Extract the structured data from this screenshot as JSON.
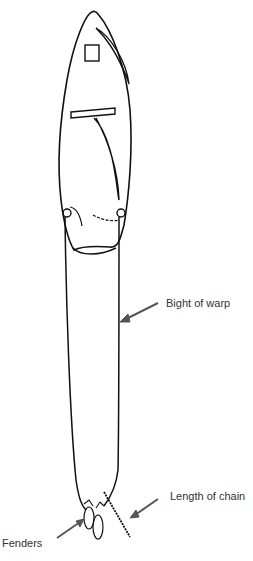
{
  "diagram": {
    "type": "boat mooring illustration (top view)",
    "labels": {
      "bight_of_warp": "Bight of warp",
      "length_of_chain": "Length of chain",
      "fenders": "Fenders"
    },
    "colors": {
      "line": "#111111",
      "arrow": "#555555",
      "text": "#333333",
      "background": "#ffffff"
    }
  }
}
